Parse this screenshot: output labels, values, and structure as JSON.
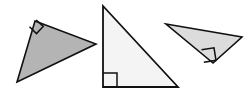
{
  "figure": {
    "canvas": {
      "width": 251,
      "height": 94,
      "background": "#ffffff"
    },
    "shapes": [
      {
        "id": "triangle-left",
        "name": "left-shaded-right-triangle",
        "type": "right-triangle",
        "fill": "#b4b4b4",
        "stroke": "#101010",
        "stroke_width": 1.6,
        "points": "35,21 96,44 17,82",
        "right_angle_vertex": "35,21",
        "angle_marker_points": "29.5,26.8 36.5,33.6 43.3,26.4 36.2,20.0",
        "angle_marker_stroke": "#101010",
        "angle_marker_width": 1.5
      },
      {
        "id": "triangle-middle",
        "name": "middle-light-right-triangle",
        "type": "right-triangle",
        "fill": "#f4f4f4",
        "stroke": "#101010",
        "stroke_width": 1.8,
        "points": "103,6 178,87 103,87",
        "right_angle_vertex": "103,87",
        "angle_marker_points": "103,73 117,73 117,87",
        "angle_marker_stroke": "#101010",
        "angle_marker_width": 1.5
      },
      {
        "id": "triangle-right",
        "name": "right-shaded-right-triangle",
        "type": "right-triangle",
        "fill": "#dcdcdc",
        "stroke": "#101010",
        "stroke_width": 1.6,
        "points": "166,24 242,37 213,63",
        "right_angle_vertex": "213,63",
        "angle_marker_points": "201.5,49.8 214.0,47.8 216.0,60.3 203.8,62.3",
        "angle_marker_stroke": "#101010",
        "angle_marker_width": 1.5
      }
    ]
  }
}
